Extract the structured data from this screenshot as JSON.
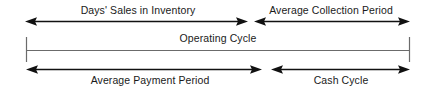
{
  "diagram": {
    "type": "timeline-span-diagram",
    "stroke_color": "#111111",
    "thin_stroke_color": "#6b6b6b",
    "background": "#ffffff",
    "rows": [
      {
        "id": "top-row",
        "spans": [
          {
            "id": "days-sales-in-inventory",
            "label": "Days' Sales in Inventory",
            "arrow_style": "double-headed",
            "x_start": 25,
            "x_end": 248,
            "label_center_x": 138,
            "label_y": 4
          },
          {
            "id": "average-collection-period",
            "label": "Average Collection Period",
            "arrow_style": "double-headed",
            "x_start": 254,
            "x_end": 410,
            "label_center_x": 331,
            "label_y": 4
          }
        ],
        "line_y": 22
      },
      {
        "id": "middle-row",
        "spans": [
          {
            "id": "operating-cycle",
            "label": "Operating Cycle",
            "arrow_style": "tick-ended-line",
            "x_start": 26,
            "x_end": 410,
            "label_center_x": 218,
            "label_y": 32
          }
        ],
        "line_y": 51
      },
      {
        "id": "bottom-row",
        "spans": [
          {
            "id": "average-payment-period",
            "label": "Average Payment Period",
            "arrow_style": "double-headed",
            "x_start": 26,
            "x_end": 262,
            "label_center_x": 150,
            "label_y": 74
          },
          {
            "id": "cash-cycle",
            "label": "Cash Cycle",
            "arrow_style": "double-headed",
            "x_start": 271,
            "x_end": 410,
            "label_center_x": 341,
            "label_y": 74
          }
        ],
        "line_y": 70
      }
    ]
  }
}
